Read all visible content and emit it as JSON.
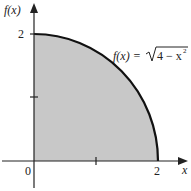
{
  "figure": {
    "y_axis_label": "f(x)",
    "x_axis_label": "x",
    "origin_label": "0",
    "y_tick_label": "2",
    "x_tick_label": "2",
    "function_label_lhs": "f(x) = ",
    "function_label_radicand": "4 − x",
    "function_label_exp": "2"
  },
  "colors": {
    "fill": "#c8c8c8",
    "curve": "#111111",
    "axis": "#222222"
  }
}
